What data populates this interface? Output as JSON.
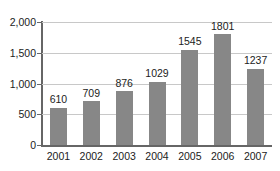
{
  "chart_data": {
    "type": "bar",
    "title": "",
    "subtitle": "",
    "xlabel": "",
    "ylabel": "",
    "categories": [
      "2001",
      "2002",
      "2003",
      "2004",
      "2005",
      "2006",
      "2007"
    ],
    "values": [
      610,
      709,
      876,
      1029,
      1545,
      1801,
      1237
    ],
    "value_labels": [
      "610",
      "709",
      "876",
      "1029",
      "1545",
      "1801",
      "1237"
    ],
    "ylim": [
      0,
      2000
    ],
    "ytick_values": [
      0,
      500,
      1000,
      1500,
      2000
    ],
    "ytick_labels": [
      "0",
      "500",
      "1,000",
      "1,500",
      "2,000"
    ],
    "grid": true,
    "legend": false,
    "legend_position": "none",
    "annotations": [],
    "colors": {
      "bar": "#878787",
      "gridline": "#c8c8c8",
      "axis": "#666666",
      "text": "#1c1c1c",
      "background": "#ffffff"
    }
  }
}
